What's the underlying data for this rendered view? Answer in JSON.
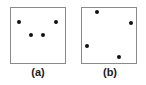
{
  "panels": [
    {
      "label": "(a)",
      "box": {
        "left": 10,
        "top": 7,
        "width": 56,
        "height": 57
      },
      "caption_pos": {
        "x": 38,
        "y": 66
      },
      "points": [
        {
          "x": 19,
          "y": 22
        },
        {
          "x": 56,
          "y": 22
        },
        {
          "x": 31,
          "y": 35
        },
        {
          "x": 43,
          "y": 35
        }
      ]
    },
    {
      "label": "(b)",
      "box": {
        "left": 81,
        "top": 7,
        "width": 56,
        "height": 57
      },
      "caption_pos": {
        "x": 110,
        "y": 66
      },
      "points": [
        {
          "x": 97,
          "y": 12
        },
        {
          "x": 131,
          "y": 23
        },
        {
          "x": 87,
          "y": 46
        },
        {
          "x": 119,
          "y": 57
        }
      ]
    }
  ],
  "colors": {
    "border": "#8a8a8a",
    "dot": "#111111",
    "text": "#1a1a1a",
    "background": "#ffffff"
  }
}
